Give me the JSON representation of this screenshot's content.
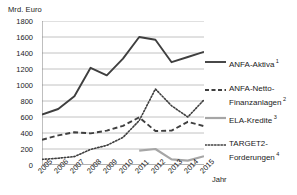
{
  "axis": {
    "y_unit_label": "Mrd. Euro",
    "x_title": "Jahr",
    "y_ticks": [
      "1800",
      "1600",
      "1400",
      "1200",
      "1000",
      "800",
      "600",
      "400",
      "200",
      "0"
    ],
    "x_ticks": [
      "2005",
      "2006",
      "2007",
      "2008",
      "2009",
      "2010",
      "2011",
      "2012",
      "2013",
      "2014",
      "2015"
    ]
  },
  "legend": {
    "items": [
      {
        "label": "ANFA-Aktiva",
        "footnote": "1",
        "label2": "",
        "style": "solid-dark",
        "color": "#3f3f3f"
      },
      {
        "label": "ANFA-Netto-",
        "footnote": "",
        "label2": "Finanzanlagen",
        "footnote2": "2",
        "style": "dashed-dark",
        "color": "#3f3f3f"
      },
      {
        "label": "ELA-Kredite",
        "footnote": "3",
        "label2": "",
        "style": "solid-gray",
        "color": "#a6a6a6"
      },
      {
        "label": "TARGET2-",
        "footnote": "",
        "label2": "Forderungen",
        "footnote2": "4",
        "style": "dotted-dark",
        "color": "#3f3f3f"
      }
    ]
  },
  "colors": {
    "anfa_aktiva": "#3f3f3f",
    "anfa_netto": "#3f3f3f",
    "ela_kredite": "#a6a6a6",
    "target2": "#3f3f3f",
    "gridline": "#b3b3b3",
    "axis": "#808080"
  },
  "chart_data": {
    "type": "line",
    "title": "",
    "subtitle": "",
    "xlabel": "Jahr",
    "ylabel": "Mrd. Euro",
    "ylim": [
      0,
      1800
    ],
    "ytick_step": 200,
    "grid": true,
    "legend_position": "right",
    "x": [
      2005,
      2006,
      2007,
      2008,
      2009,
      2010,
      2011,
      2012,
      2013,
      2014,
      2015
    ],
    "series": [
      {
        "name": "ANFA-Aktiva",
        "footnote": "1",
        "style": "solid",
        "color": "#3f3f3f",
        "values": [
          630,
          700,
          860,
          1215,
          1120,
          1330,
          1600,
          1565,
          1285,
          1350,
          1415
        ]
      },
      {
        "name": "ANFA-Netto-Finanzanlagen",
        "footnote": "2",
        "style": "dashed",
        "color": "#3f3f3f",
        "values": [
          315,
          370,
          410,
          395,
          430,
          490,
          595,
          425,
          430,
          540,
          485
        ]
      },
      {
        "name": "ELA-Kredite",
        "footnote": "3",
        "style": "solid",
        "color": "#a6a6a6",
        "values": [
          null,
          null,
          null,
          null,
          null,
          null,
          180,
          200,
          70,
          55,
          110
        ]
      },
      {
        "name": "TARGET2-Forderungen",
        "footnote": "4",
        "style": "dotted",
        "color": "#3f3f3f",
        "values": [
          70,
          85,
          105,
          195,
          245,
          345,
          555,
          950,
          740,
          600,
          815
        ]
      }
    ]
  }
}
